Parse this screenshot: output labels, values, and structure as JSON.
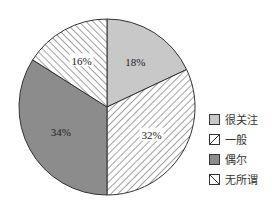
{
  "chart_data": {
    "type": "pie",
    "title": "",
    "categories": [
      "很关注",
      "一般",
      "偶尔",
      "无所谓"
    ],
    "values": [
      18,
      32,
      34,
      16
    ],
    "unit": "%",
    "labels": [
      "18%",
      "32%",
      "34%",
      "16%"
    ],
    "fills": [
      "solid-light",
      "hatch-forward",
      "solid-dark",
      "hatch-back"
    ],
    "colors": [
      "#c8c8c8",
      "#ffffff",
      "#8c8c8c",
      "#ffffff"
    ],
    "start_angle_deg": 0,
    "direction": "clockwise",
    "legend_position": "right"
  },
  "legend": {
    "items": [
      {
        "label": "很关注"
      },
      {
        "label": "一般"
      },
      {
        "label": "偶尔"
      },
      {
        "label": "无所谓"
      }
    ]
  }
}
